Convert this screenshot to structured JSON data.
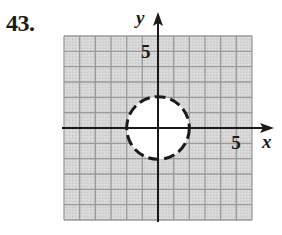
{
  "problem": {
    "number": "43."
  },
  "colors": {
    "shade": "#d4d4d4",
    "grid": "#9a9a9a",
    "axis": "#1a1a1a",
    "circle": "#1a1a1a",
    "inside": "#ffffff"
  },
  "chart_data": {
    "type": "inequality-graph",
    "title": "",
    "xlabel": "x",
    "ylabel": "y",
    "xlim": [
      -6,
      6
    ],
    "ylim": [
      -6,
      6
    ],
    "grid": true,
    "grid_step": 1,
    "tick_labels": [
      {
        "axis": "x",
        "value": 5,
        "label": "5"
      },
      {
        "axis": "y",
        "value": 5,
        "label": "5"
      }
    ],
    "boundary": {
      "shape": "circle",
      "center": [
        0,
        0
      ],
      "radius": 2,
      "style": "dashed",
      "equation": "x^2 + y^2 = 4"
    },
    "shaded_region": "outside",
    "inequality": "x^2 + y^2 > 4"
  }
}
